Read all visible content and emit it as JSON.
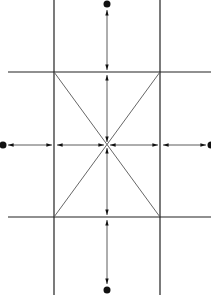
{
  "diagram": {
    "title": "",
    "colors": {
      "line": "#222222",
      "thin": "#555555",
      "dot": "#111111",
      "background": "#ffffff"
    },
    "grid": {
      "vertical_lines_x": [
        54,
        160
      ],
      "horizontal_lines_y": [
        72,
        217
      ],
      "vertical_extent": [
        0,
        295
      ],
      "horizontal_extent": [
        8,
        211
      ]
    },
    "center": [
      107,
      145
    ],
    "diagonals": [
      {
        "from": [
          54,
          72
        ],
        "to": [
          160,
          217
        ]
      },
      {
        "from": [
          160,
          72
        ],
        "to": [
          54,
          217
        ]
      }
    ],
    "dots": [
      {
        "name": "top",
        "pos": [
          107,
          4
        ]
      },
      {
        "name": "bottom",
        "pos": [
          107,
          290
        ]
      },
      {
        "name": "left",
        "pos": [
          3,
          145
        ]
      },
      {
        "name": "right",
        "pos": [
          211,
          145
        ]
      }
    ]
  }
}
